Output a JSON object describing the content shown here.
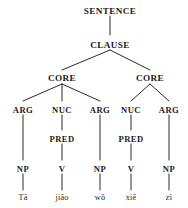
{
  "diagram": {
    "line_color": "#2a2a2a",
    "text_color": "#1b1b1b",
    "background": "#ffffff",
    "nodes": {
      "sentence": "SENTENCE",
      "clause": "CLAUSE",
      "core_left": "CORE",
      "core_right": "CORE",
      "arg1": "ARG",
      "nuc1": "NUC",
      "arg2": "ARG",
      "nuc2": "NUC",
      "arg3": "ARG",
      "pred1": "PRED",
      "pred2": "PRED",
      "np1": "NP",
      "v1": "V",
      "np2": "NP",
      "v2": "V",
      "np3": "NP",
      "word1": "Tā",
      "word2": "jiāo",
      "word3": "wǒ",
      "word4": "xiě",
      "word5": "zì"
    }
  }
}
